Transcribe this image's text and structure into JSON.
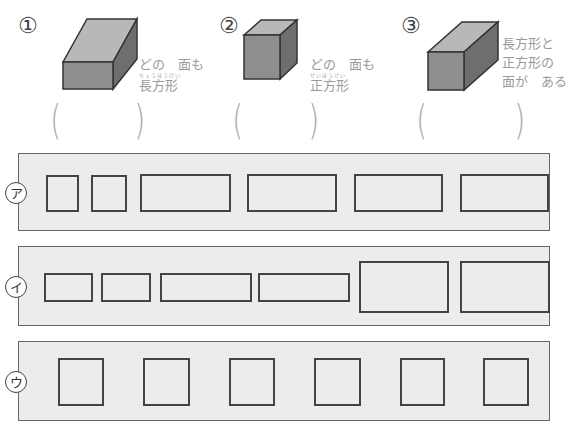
{
  "questions": [
    {
      "number": "①",
      "shape": "rectangular-prism-flat",
      "caption_lines": [
        "どの　面も",
        "長方形"
      ],
      "ruby": "ちょうほうけい",
      "answer_open": "(",
      "answer_close": ")"
    },
    {
      "number": "②",
      "shape": "cube",
      "caption_lines": [
        "どの　面も",
        "正方形"
      ],
      "ruby": "せいほうけい",
      "answer_open": "(",
      "answer_close": ")"
    },
    {
      "number": "③",
      "shape": "square-prism",
      "caption_lines": [
        "長方形と",
        "正方形の",
        "面が　ある"
      ],
      "answer_open": "(",
      "answer_close": ")"
    }
  ],
  "rows": [
    {
      "label": "ア",
      "faces": [
        {
          "x": 46,
          "y": 175,
          "w": 33,
          "h": 37
        },
        {
          "x": 91,
          "y": 175,
          "w": 36,
          "h": 37
        },
        {
          "x": 140,
          "y": 174,
          "w": 91,
          "h": 38
        },
        {
          "x": 247,
          "y": 174,
          "w": 90,
          "h": 38
        },
        {
          "x": 354,
          "y": 174,
          "w": 89,
          "h": 38
        },
        {
          "x": 460,
          "y": 174,
          "w": 89,
          "h": 38
        }
      ]
    },
    {
      "label": "イ",
      "faces": [
        {
          "x": 44,
          "y": 273,
          "w": 49,
          "h": 29
        },
        {
          "x": 101,
          "y": 273,
          "w": 50,
          "h": 29
        },
        {
          "x": 160,
          "y": 273,
          "w": 92,
          "h": 29
        },
        {
          "x": 258,
          "y": 273,
          "w": 92,
          "h": 29
        },
        {
          "x": 359,
          "y": 261,
          "w": 90,
          "h": 52
        },
        {
          "x": 460,
          "y": 261,
          "w": 90,
          "h": 52
        }
      ]
    },
    {
      "label": "ウ",
      "faces": [
        {
          "x": 58,
          "y": 358,
          "w": 46,
          "h": 48
        },
        {
          "x": 143,
          "y": 358,
          "w": 47,
          "h": 48
        },
        {
          "x": 229,
          "y": 358,
          "w": 46,
          "h": 48
        },
        {
          "x": 314,
          "y": 358,
          "w": 47,
          "h": 48
        },
        {
          "x": 400,
          "y": 358,
          "w": 45,
          "h": 48
        },
        {
          "x": 483,
          "y": 358,
          "w": 46,
          "h": 48
        }
      ]
    }
  ],
  "colors": {
    "panel_bg": "#ececec",
    "border": "#444444",
    "caption_text": "#9a9a9a",
    "paren": "#aaaaaa",
    "box_front": "#8e8e8e",
    "box_top": "#b8b8b8",
    "box_side": "#6e6e6e"
  }
}
